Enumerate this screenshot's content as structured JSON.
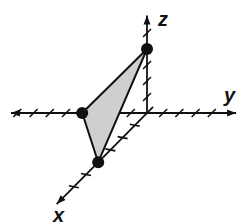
{
  "diagram": {
    "type": "3d-coordinate-plot",
    "axes": {
      "x": {
        "label": "x",
        "ticks_positive": 6,
        "ticks_negative": 1
      },
      "y": {
        "label": "y",
        "ticks_positive": 4,
        "ticks_negative": 8
      },
      "z": {
        "label": "z",
        "ticks_positive": 5,
        "ticks_negative": 0
      }
    },
    "points": [
      {
        "name": "x-intercept",
        "coords": [
          4,
          0,
          0
        ]
      },
      {
        "name": "y-intercept",
        "coords": [
          0,
          -4,
          0
        ]
      },
      {
        "name": "z-intercept",
        "coords": [
          0,
          0,
          4
        ]
      }
    ],
    "triangle": {
      "vertices": [
        [
          4,
          0,
          0
        ],
        [
          0,
          -4,
          0
        ],
        [
          0,
          0,
          4
        ]
      ],
      "fill": "#cfcfcf",
      "stroke": "#111111"
    },
    "colors": {
      "axis": "#111111",
      "point": "#111111"
    }
  }
}
